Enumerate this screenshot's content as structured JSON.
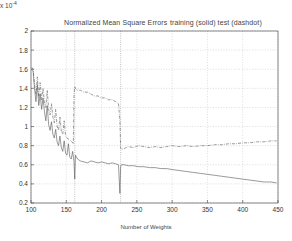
{
  "chart_data": {
    "type": "line",
    "title": "Normalized Mean Square Errors",
    "legend_text": "training (solid)  test (dashdot)",
    "exponent_label": "x 10",
    "exponent_power": "-4",
    "xlabel": "Number of Weights",
    "ylabel": "",
    "xlim": [
      100,
      450
    ],
    "ylim": [
      0.2,
      2.0
    ],
    "xticks": [
      100,
      150,
      200,
      250,
      300,
      350,
      400,
      450
    ],
    "yticks": [
      0.2,
      0.4,
      0.6,
      0.8,
      1,
      1.2,
      1.4,
      1.6,
      1.8,
      2
    ],
    "ytick_labels": [
      "0.2",
      "0.4",
      "0.6",
      "0.8",
      "1",
      "1.2",
      "1.4",
      "1.6",
      "1.8",
      "2"
    ],
    "xtick_labels": [
      "100",
      "150",
      "200",
      "250",
      "300",
      "350",
      "400",
      "450"
    ],
    "grid": true,
    "legend_position": "above-right",
    "vlines": [
      162,
      227
    ],
    "series": [
      {
        "name": "training (solid)",
        "style": "solid",
        "color": "#555555",
        "x": [
          101,
          103,
          105,
          107,
          109,
          111,
          113,
          115,
          117,
          119,
          121,
          123,
          125,
          127,
          129,
          131,
          133,
          135,
          137,
          139,
          141,
          143,
          145,
          147,
          149,
          151,
          153,
          155,
          157,
          159,
          161,
          162,
          163,
          166,
          170,
          175,
          180,
          185,
          190,
          195,
          200,
          205,
          210,
          215,
          220,
          224,
          226,
          227,
          228,
          232,
          238,
          245,
          252,
          260,
          268,
          276,
          284,
          292,
          300,
          310,
          320,
          330,
          340,
          350,
          360,
          370,
          380,
          390,
          400,
          410,
          420,
          430,
          440,
          448
        ],
        "y": [
          1.6,
          1.58,
          1.4,
          1.26,
          1.44,
          1.22,
          1.34,
          1.18,
          1.3,
          1.16,
          1.06,
          1.22,
          1.02,
          0.96,
          1.05,
          0.92,
          0.88,
          0.97,
          0.84,
          0.8,
          0.9,
          0.78,
          0.74,
          0.85,
          0.72,
          0.7,
          0.82,
          0.68,
          0.66,
          0.74,
          0.63,
          0.45,
          0.7,
          0.66,
          0.64,
          0.63,
          0.62,
          0.64,
          0.63,
          0.62,
          0.63,
          0.62,
          0.61,
          0.62,
          0.61,
          0.6,
          0.3,
          0.58,
          0.6,
          0.6,
          0.59,
          0.59,
          0.58,
          0.58,
          0.57,
          0.57,
          0.56,
          0.56,
          0.55,
          0.54,
          0.53,
          0.52,
          0.51,
          0.5,
          0.49,
          0.48,
          0.47,
          0.46,
          0.45,
          0.44,
          0.43,
          0.42,
          0.42,
          0.41
        ]
      },
      {
        "name": "test (dashdot)",
        "style": "dashdot",
        "color": "#555555",
        "x": [
          101,
          103,
          105,
          107,
          109,
          111,
          113,
          115,
          117,
          119,
          121,
          123,
          125,
          127,
          129,
          131,
          133,
          135,
          137,
          139,
          141,
          143,
          145,
          147,
          149,
          151,
          155,
          158,
          160,
          161,
          162,
          163,
          166,
          170,
          175,
          180,
          185,
          190,
          195,
          200,
          205,
          210,
          215,
          220,
          224,
          226,
          227,
          228,
          232,
          238,
          245,
          252,
          260,
          268,
          276,
          284,
          292,
          300,
          310,
          320,
          330,
          340,
          350,
          360,
          370,
          380,
          390,
          400,
          410,
          420,
          430,
          440,
          448
        ],
        "y": [
          1.62,
          1.6,
          1.44,
          1.34,
          1.52,
          1.3,
          1.46,
          1.28,
          1.4,
          1.26,
          1.2,
          1.38,
          1.18,
          1.12,
          1.24,
          1.1,
          1.04,
          1.18,
          1.0,
          0.96,
          1.1,
          0.95,
          0.92,
          1.06,
          0.9,
          0.88,
          0.86,
          0.84,
          0.82,
          1.35,
          1.42,
          1.4,
          1.38,
          1.38,
          1.36,
          1.36,
          1.34,
          1.32,
          1.32,
          1.3,
          1.3,
          1.28,
          1.28,
          1.26,
          1.24,
          1.06,
          0.78,
          0.76,
          0.77,
          0.79,
          0.78,
          0.8,
          0.79,
          0.78,
          0.79,
          0.78,
          0.79,
          0.8,
          0.79,
          0.8,
          0.79,
          0.8,
          0.8,
          0.81,
          0.81,
          0.82,
          0.82,
          0.83,
          0.83,
          0.84,
          0.84,
          0.85,
          0.85
        ]
      }
    ]
  }
}
